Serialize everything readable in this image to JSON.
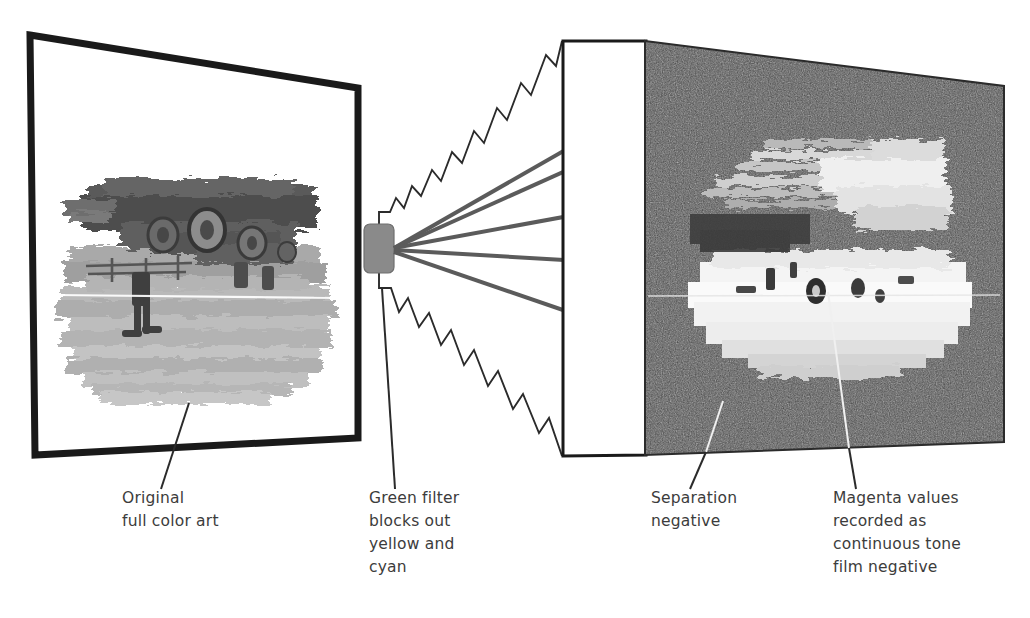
{
  "figure": {
    "title_semantics": "color separation photography diagram",
    "panels": {
      "artwork": {
        "name": "Original full color art",
        "surface": "white board with thick black border, shown in perspective",
        "artwork_description": "grayscale painterly landscape with figures and wheels"
      },
      "filter": {
        "name": "Green filter",
        "color": "#8a8a8a",
        "ray_count": 5
      },
      "negative": {
        "name": "Separation negative",
        "surface": "dark grainy film emulsion with white edge strip",
        "base_color": "#464646",
        "edge_strip_color": "#ffffff",
        "image_description": "inverted high contrast negative of the artwork"
      }
    }
  },
  "captions": [
    {
      "id": "original-art",
      "lines": [
        "Original",
        "full color art"
      ],
      "x": 122,
      "y": 503
    },
    {
      "id": "green-filter",
      "lines": [
        "Green filter",
        "blocks out",
        "yellow and",
        "cyan"
      ],
      "x": 369,
      "y": 503
    },
    {
      "id": "separation-negative",
      "lines": [
        "Separation",
        "negative"
      ],
      "x": 651,
      "y": 503
    },
    {
      "id": "magenta-values",
      "lines": [
        "Magenta values",
        "recorded as",
        "continuous tone",
        "film negative"
      ],
      "x": 833,
      "y": 503
    }
  ],
  "colors": {
    "ink": "#2b2b2b",
    "caption": "#3c3c3c",
    "filter_gray": "#8a8a8a",
    "ray_gray": "#5b5b5b",
    "negative_dark": "#464646",
    "panel_border": "#1a1a1a",
    "leader_white": "#f0f0f0"
  },
  "geometry": {
    "art_panel_corners": [
      [
        30,
        35
      ],
      [
        358,
        88
      ],
      [
        358,
        438
      ],
      [
        35,
        455
      ]
    ],
    "film_edge_corners": [
      [
        563,
        41
      ],
      [
        645,
        41
      ],
      [
        645,
        455
      ],
      [
        563,
        456
      ]
    ],
    "negative_corners": [
      [
        645,
        41
      ],
      [
        1004,
        86
      ],
      [
        1004,
        442
      ],
      [
        645,
        455
      ]
    ],
    "filter_rect": {
      "x": 364,
      "y": 224,
      "w": 30,
      "h": 49
    },
    "ray_origin": [
      394,
      248
    ],
    "ray_tips": [
      [
        620,
        118
      ],
      [
        625,
        143
      ],
      [
        622,
        205
      ],
      [
        637,
        264
      ],
      [
        628,
        333
      ]
    ]
  }
}
